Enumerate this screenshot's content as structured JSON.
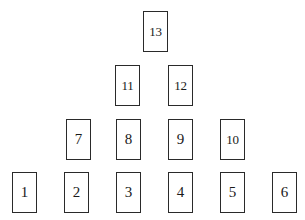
{
  "diagram": {
    "type": "pyramid-node-layout",
    "background_color": "#ffffff",
    "node_fill_color": "#ffffff",
    "node_border_color": "#2a2a2a",
    "node_text_color": "#1a1a1a",
    "node_width": 25,
    "node_height": 41,
    "rows": [
      {
        "row_index": 1,
        "y": 11,
        "nodes": [
          {
            "label": "13",
            "x": 143,
            "column": 3
          }
        ]
      },
      {
        "row_index": 2,
        "y": 65,
        "nodes": [
          {
            "label": "11",
            "x": 115,
            "column": 2
          },
          {
            "label": "12",
            "x": 168,
            "column": 3
          }
        ]
      },
      {
        "row_index": 3,
        "y": 119,
        "nodes": [
          {
            "label": "7",
            "x": 66,
            "column": 1
          },
          {
            "label": "8",
            "x": 116,
            "column": 2
          },
          {
            "label": "9",
            "x": 168,
            "column": 3
          },
          {
            "label": "10",
            "x": 220,
            "column": 4
          }
        ]
      },
      {
        "row_index": 4,
        "y": 172,
        "nodes": [
          {
            "label": "1",
            "x": 12,
            "column": 0
          },
          {
            "label": "2",
            "x": 64,
            "column": 1
          },
          {
            "label": "3",
            "x": 116,
            "column": 2
          },
          {
            "label": "4",
            "x": 168,
            "column": 3
          },
          {
            "label": "5",
            "x": 220,
            "column": 4
          },
          {
            "label": "6",
            "x": 272,
            "column": 5
          }
        ]
      }
    ]
  }
}
